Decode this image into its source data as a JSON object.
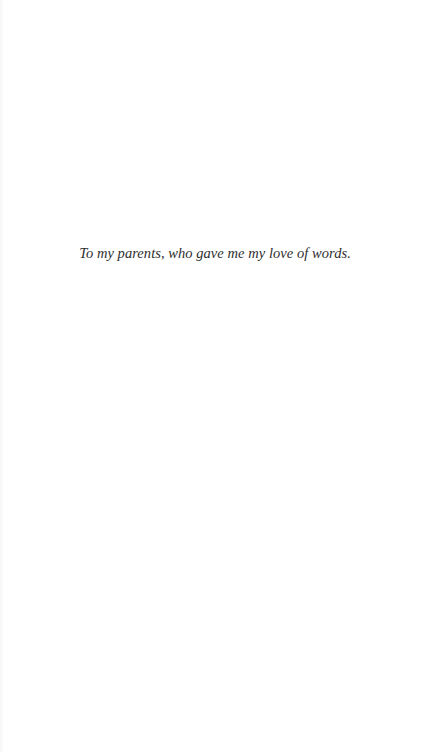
{
  "page": {
    "dedication": "To my parents, who gave me my love of words.",
    "background_color": "#ffffff",
    "text_color": "#2e2e2e"
  }
}
